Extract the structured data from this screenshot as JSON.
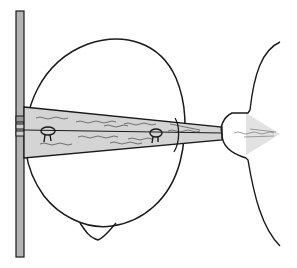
{
  "diagram": {
    "type": "line-drawing",
    "elements": [
      "vertical-plate",
      "head-outline-top-view",
      "nose",
      "beam-projection",
      "ear-left",
      "ear-right",
      "receiver-face-profile",
      "receiver-cone"
    ]
  },
  "colors": {
    "stroke": "#1a1a1a",
    "plate_fill": "#b4b4b4",
    "beam_fill": "#d4d4d4",
    "cone_fill": "#e2e2e2",
    "background": "#ffffff"
  }
}
